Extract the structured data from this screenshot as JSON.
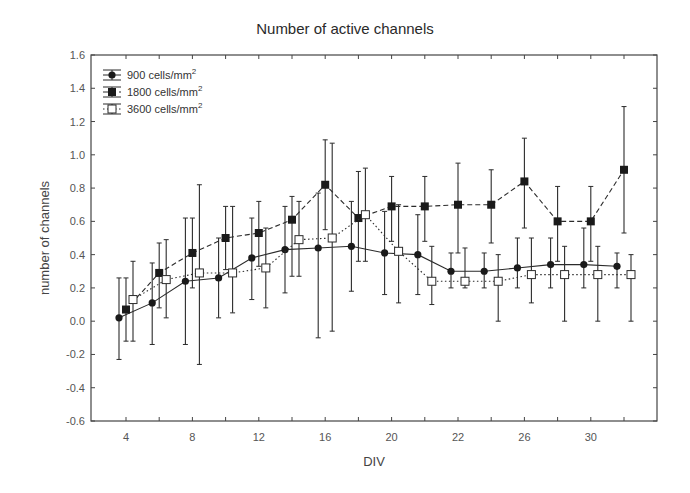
{
  "chart_data": {
    "type": "line",
    "title": "Number of active channels",
    "xlabel": "DIV",
    "ylabel": "number of channels",
    "ylim": [
      -0.6,
      1.6
    ],
    "yticks": [
      -0.6,
      -0.4,
      -0.2,
      0.0,
      0.2,
      0.4,
      0.6,
      0.8,
      1.0,
      1.2,
      1.4,
      1.6
    ],
    "ytick_labels": [
      "-0.6",
      "-0.4",
      "-0.2",
      "0.0",
      "0.2",
      "0.4",
      "0.6",
      "0.8",
      "1.0",
      "1.2",
      "1.4",
      "1.6"
    ],
    "x_positions": 16,
    "xtick_labels": [
      {
        "index": 0,
        "label": "4"
      },
      {
        "index": 2,
        "label": "8"
      },
      {
        "index": 4,
        "label": "12"
      },
      {
        "index": 6,
        "label": "16"
      },
      {
        "index": 8,
        "label": "20"
      },
      {
        "index": 10,
        "label": "22"
      },
      {
        "index": 12,
        "label": "26"
      },
      {
        "index": 14,
        "label": "30"
      }
    ],
    "grid": false,
    "legend_position": "upper left",
    "error_bars": true,
    "series": [
      {
        "name": "900 cells/mm²",
        "marker": "filled-circle",
        "line": "solid",
        "offset": -7,
        "values": [
          0.02,
          0.11,
          0.24,
          0.26,
          0.38,
          0.43,
          0.44,
          0.45,
          0.41,
          0.4,
          0.3,
          0.3,
          0.32,
          0.34,
          0.34,
          0.33
        ],
        "upper": [
          0.26,
          0.35,
          0.62,
          0.5,
          0.62,
          0.69,
          0.77,
          0.72,
          0.66,
          0.64,
          0.41,
          0.41,
          0.5,
          0.5,
          0.56,
          0.41
        ],
        "lower": [
          -0.23,
          -0.14,
          -0.14,
          0.02,
          0.13,
          0.17,
          -0.1,
          0.18,
          0.16,
          0.16,
          0.2,
          0.2,
          0.2,
          0.2,
          0.2,
          0.2
        ]
      },
      {
        "name": "1800 cells/mm²",
        "marker": "filled-square",
        "line": "dashed",
        "offset": 0,
        "values": [
          0.07,
          0.29,
          0.41,
          0.5,
          0.53,
          0.61,
          0.82,
          0.62,
          0.69,
          0.69,
          0.7,
          0.7,
          0.84,
          0.6,
          0.6,
          0.91
        ],
        "upper": [
          0.26,
          0.47,
          0.62,
          0.69,
          0.72,
          0.75,
          1.09,
          0.9,
          0.87,
          0.87,
          0.95,
          0.91,
          1.1,
          0.81,
          0.81,
          1.29
        ],
        "lower": [
          -0.12,
          0.08,
          0.2,
          0.31,
          0.33,
          0.27,
          0.55,
          0.36,
          0.48,
          0.48,
          0.41,
          0.47,
          0.56,
          0.36,
          0.36,
          0.53
        ]
      },
      {
        "name": "3600 cells/mm²",
        "marker": "open-square",
        "line": "dotted",
        "offset": 7,
        "values": [
          0.13,
          0.25,
          0.29,
          0.29,
          0.32,
          0.49,
          0.5,
          0.64,
          0.42,
          0.24,
          0.24,
          0.24,
          0.28,
          0.28,
          0.28,
          0.28
        ],
        "upper": [
          0.36,
          0.49,
          0.82,
          0.69,
          0.56,
          0.72,
          1.07,
          0.92,
          0.7,
          0.45,
          0.44,
          0.4,
          0.5,
          0.45,
          0.45,
          0.4
        ],
        "lower": [
          -0.12,
          0.02,
          -0.26,
          0.05,
          0.08,
          0.27,
          -0.06,
          0.36,
          0.11,
          0.1,
          0.2,
          0.0,
          0.11,
          0.0,
          0.0,
          0.0
        ]
      }
    ]
  },
  "legend": {
    "items": [
      {
        "label": "900 cells/mm",
        "sup": "2"
      },
      {
        "label": "1800 cells/mm",
        "sup": "2"
      },
      {
        "label": "3600 cells/mm",
        "sup": "2"
      }
    ]
  },
  "colors": {
    "line": "#2b2b2b",
    "axis": "#444444",
    "marker_fill_dark": "#1a1a1a",
    "marker_fill_open": "#ffffff"
  }
}
